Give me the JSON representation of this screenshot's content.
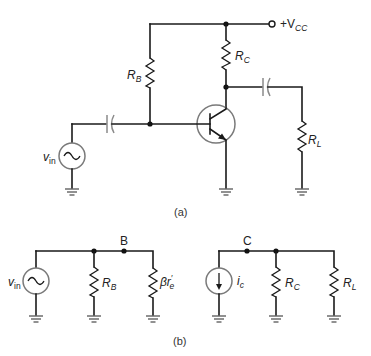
{
  "figure": {
    "part_a": {
      "caption": "(a)",
      "labels": {
        "vcc_prefix": "+V",
        "vcc_sub": "CC",
        "rb_main": "R",
        "rb_sub": "B",
        "rc_main": "R",
        "rc_sub": "C",
        "rl_main": "R",
        "rl_sub": "L",
        "vin_main": "v",
        "vin_sub": "in"
      },
      "components": [
        "V_CC supply terminal",
        "R_B base resistor",
        "R_C collector resistor",
        "NPN transistor",
        "input coupling capacitor",
        "output coupling capacitor",
        "R_L load resistor",
        "v_in AC source",
        "ground x3"
      ]
    },
    "part_b": {
      "caption": "(b)",
      "node_b": "B",
      "node_c": "C",
      "labels": {
        "vin_main": "v",
        "vin_sub": "in",
        "rb_main": "R",
        "rb_sub": "B",
        "beta_re": "βr",
        "beta_re_prime": "′",
        "beta_re_sub": "e",
        "ic_main": "i",
        "ic_sub": "c",
        "rc_main": "R",
        "rc_sub": "C",
        "rl_main": "R",
        "rl_sub": "L"
      }
    }
  }
}
